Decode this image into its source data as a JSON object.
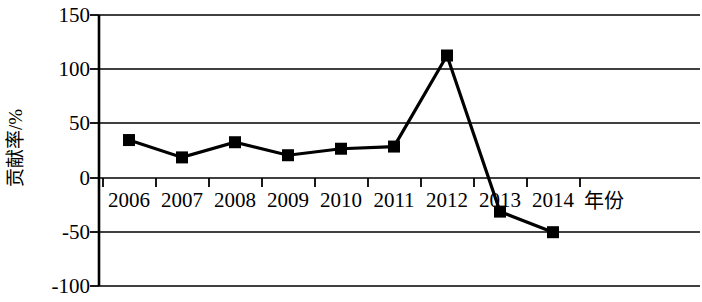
{
  "chart_data": {
    "type": "line",
    "title": "",
    "xlabel": "年份",
    "ylabel": "贡献率/%",
    "categories": [
      "2006",
      "2007",
      "2008",
      "2009",
      "2010",
      "2011",
      "2012",
      "2013",
      "2014"
    ],
    "values": [
      35,
      19,
      33,
      21,
      27,
      29,
      113,
      -31,
      -50
    ],
    "series": [
      {
        "name": "贡献率",
        "values": [
          35,
          19,
          33,
          21,
          27,
          29,
          113,
          -31,
          -50
        ],
        "color": "#000000",
        "marker": "square",
        "line_width": 3
      }
    ],
    "ylim": [
      -100,
      150
    ],
    "yticks": [
      150,
      100,
      50,
      0,
      -50,
      -100
    ],
    "ytick_labels": [
      "150",
      "100",
      "50",
      "0",
      "-50",
      "-100"
    ],
    "xticks": [
      "2006",
      "2007",
      "2008",
      "2009",
      "2010",
      "2011",
      "2012",
      "2013",
      "2014"
    ],
    "grid": true,
    "grid_axis": "y",
    "grid_color": "#000000",
    "legend": false,
    "legend_position": "none",
    "background": "#ffffff",
    "axis_color": "#000000"
  },
  "axes": {
    "y_title": "贡献率/%",
    "x_title": "年份",
    "y_tick_labels": [
      "150",
      "100",
      "50",
      "0",
      "-50",
      "-100"
    ],
    "x_tick_labels": [
      "2006",
      "2007",
      "2008",
      "2009",
      "2010",
      "2011",
      "2012",
      "2013",
      "2014"
    ]
  }
}
